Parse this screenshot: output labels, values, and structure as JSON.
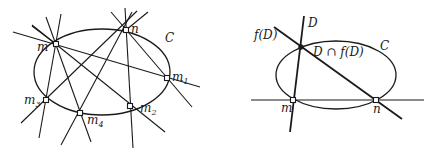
{
  "figure_left": {
    "conic_label": "C",
    "points": [
      {
        "id": "m",
        "label": "m",
        "sub": ""
      },
      {
        "id": "n",
        "label": "n",
        "sub": ""
      },
      {
        "id": "m1",
        "label": "m",
        "sub": "1"
      },
      {
        "id": "m2",
        "label": "m",
        "sub": "2"
      },
      {
        "id": "m3",
        "label": "m",
        "sub": "3"
      },
      {
        "id": "m4",
        "label": "m",
        "sub": "4"
      }
    ]
  },
  "figure_right": {
    "conic_label": "C",
    "line_d_label": "D",
    "line_fd_label": "f(D)",
    "intersection_label": "D ∩ f(D)",
    "point_m_label": "m",
    "point_n_label": "n"
  },
  "colors": {
    "ink": "#1a1a1a",
    "background": "#ffffff"
  }
}
